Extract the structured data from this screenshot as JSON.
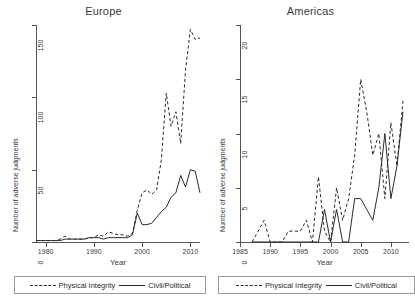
{
  "figure": {
    "width": 414,
    "height": 300,
    "background": "#ffffff",
    "line_color": "#2b2b2b",
    "axis_color": "#555555"
  },
  "panels": [
    {
      "id": "europe",
      "title": "Europe",
      "ylabel": "Number of adverse judgments",
      "xlabel": "Year"
    },
    {
      "id": "americas",
      "title": "Americas",
      "ylabel": "Number of adverse judgments",
      "xlabel": "Year"
    }
  ],
  "legend": {
    "physical_integrity_label": "Physical Integrity",
    "civil_political_label": "Civil/Political"
  },
  "chart_data": [
    {
      "type": "line",
      "title": "Europe",
      "xlabel": "Year",
      "ylabel": "Number of adverse judgments",
      "xlim": [
        1978,
        2012
      ],
      "ylim": [
        0,
        150
      ],
      "xticks": [
        1980,
        1990,
        2000,
        2010
      ],
      "yticks": [
        0,
        50,
        100,
        150
      ],
      "xtick_labels": [
        "1980",
        "1990",
        "2000",
        "2010"
      ],
      "ytick_labels": [
        "0",
        "50",
        "100",
        "150"
      ],
      "grid": false,
      "legend_position": "below",
      "x": [
        1978,
        1979,
        1980,
        1981,
        1982,
        1983,
        1984,
        1985,
        1986,
        1987,
        1988,
        1989,
        1990,
        1991,
        1992,
        1993,
        1994,
        1995,
        1996,
        1997,
        1998,
        1999,
        2000,
        2001,
        2002,
        2003,
        2004,
        2005,
        2006,
        2007,
        2008,
        2009,
        2010,
        2011,
        2012
      ],
      "series": [
        {
          "name": "Physical Integrity",
          "style": "dashed",
          "values": [
            1,
            1,
            1,
            1,
            1,
            2,
            4,
            2,
            2,
            2,
            2,
            3,
            3,
            5,
            4,
            7,
            6,
            5,
            5,
            4,
            6,
            22,
            34,
            36,
            33,
            36,
            57,
            103,
            80,
            90,
            68,
            119,
            147,
            140,
            141
          ]
        },
        {
          "name": "Civil/Political",
          "style": "solid",
          "values": [
            1,
            1,
            1,
            1,
            1,
            1,
            2,
            2,
            2,
            2,
            2,
            3,
            3,
            3,
            2,
            3,
            3,
            3,
            3,
            3,
            5,
            20,
            12,
            12,
            13,
            17,
            21,
            24,
            31,
            34,
            46,
            38,
            50,
            49,
            34
          ]
        }
      ]
    },
    {
      "type": "line",
      "title": "Americas",
      "xlabel": "Year",
      "ylabel": "Number of adverse judgments",
      "xlim": [
        1985,
        2013
      ],
      "ylim": [
        0,
        20
      ],
      "xticks": [
        1985,
        1990,
        1995,
        2000,
        2005,
        2010
      ],
      "yticks": [
        0,
        5,
        10,
        15,
        20
      ],
      "xtick_labels": [
        "1985",
        "1990",
        "1995",
        "2000",
        "2005",
        "2010"
      ],
      "ytick_labels": [
        "0",
        "5",
        "10",
        "15",
        "20"
      ],
      "grid": false,
      "legend_position": "below",
      "x": [
        1987,
        1988,
        1989,
        1990,
        1991,
        1992,
        1993,
        1994,
        1995,
        1996,
        1997,
        1998,
        1999,
        2000,
        2001,
        2002,
        2003,
        2004,
        2005,
        2006,
        2007,
        2008,
        2009,
        2010,
        2011,
        2012
      ],
      "series": [
        {
          "name": "Physical Integrity",
          "style": "dashed",
          "values": [
            0,
            1,
            2,
            0,
            0,
            0,
            1,
            1,
            1,
            2,
            0,
            6,
            1,
            0,
            5,
            2,
            4,
            8,
            15,
            12,
            8,
            10,
            4,
            11,
            7,
            13
          ]
        },
        {
          "name": "Civil/Political",
          "style": "solid",
          "values": [
            0,
            0,
            0,
            0,
            0,
            0,
            0,
            0,
            0,
            0,
            0,
            0,
            3,
            0,
            3,
            0,
            0,
            4,
            4,
            3,
            2,
            5,
            10,
            4,
            7,
            12
          ]
        }
      ]
    }
  ]
}
